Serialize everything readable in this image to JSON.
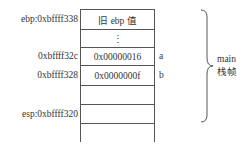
{
  "stack": {
    "cells": [
      {
        "content": "旧 ebp 值",
        "address": "ebp:0xbffff338",
        "variable": ""
      },
      {
        "content": "⋮",
        "address": "",
        "variable": ""
      },
      {
        "content": "0x00000016",
        "address": "0xbffff32c",
        "variable": "a"
      },
      {
        "content": "0x0000000f",
        "address": "0xbffff328",
        "variable": "b"
      },
      {
        "content": "",
        "address": "",
        "variable": ""
      },
      {
        "content": "",
        "address": "esp:0xbffff320",
        "variable": ""
      }
    ]
  },
  "frame": {
    "name": "main",
    "label": "栈帧"
  }
}
